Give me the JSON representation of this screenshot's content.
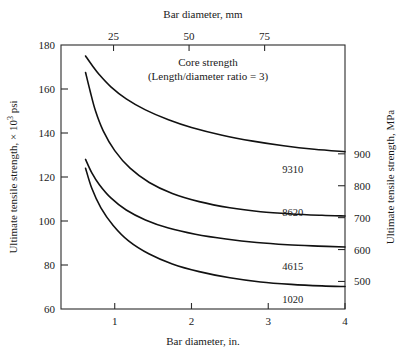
{
  "chart_data": {
    "type": "line",
    "title": "",
    "annotation": {
      "line1": "Core strength",
      "line2": "(Length/diameter ratio = 3)"
    },
    "xlabel": "Bar diameter, in.",
    "xlabel_top": "Bar diameter, mm",
    "ylabel": "Ultimate tensile strength, × 10³ psi",
    "ylabel_right": "Ultimate tensile strength, MPa",
    "xlim": [
      0.3,
      4.0
    ],
    "ylim": [
      60,
      180
    ],
    "xticks": [
      1,
      2,
      3,
      4
    ],
    "xticklabels": [
      "1",
      "2",
      "3",
      "4"
    ],
    "xticks_top_mm": [
      25,
      50,
      75
    ],
    "xticklabels_top": [
      "25",
      "50",
      "75"
    ],
    "yticks": [
      60,
      80,
      100,
      120,
      140,
      160,
      180
    ],
    "yticklabels": [
      "60",
      "80",
      "100",
      "120",
      "140",
      "160",
      "180"
    ],
    "yticks_right_mpa": [
      500,
      600,
      700,
      800,
      900
    ],
    "yticklabels_right": [
      "500",
      "600",
      "700",
      "800",
      "900"
    ],
    "grid": false,
    "legend_position": "inline-end-of-curve",
    "series": [
      {
        "name": "9310",
        "label": "9310",
        "label_x": 3.32,
        "label_y": 123.5,
        "x": [
          0.62,
          0.7,
          0.8,
          0.95,
          1.15,
          1.4,
          1.7,
          2.0,
          2.4,
          2.8,
          3.2,
          3.6,
          4.0
        ],
        "y": [
          175.0,
          171.0,
          166.5,
          161.0,
          155.5,
          150.5,
          146.0,
          142.5,
          139.0,
          136.3,
          134.2,
          132.6,
          131.5
        ]
      },
      {
        "name": "8620",
        "label": "8620",
        "label_x": 3.32,
        "label_y": 104.0,
        "x": [
          0.62,
          0.68,
          0.75,
          0.85,
          1.0,
          1.2,
          1.45,
          1.75,
          2.1,
          2.5,
          2.9,
          3.3,
          3.7,
          4.0
        ],
        "y": [
          167.5,
          159.0,
          150.0,
          141.0,
          132.0,
          124.0,
          117.5,
          112.5,
          108.8,
          106.0,
          104.2,
          103.2,
          102.6,
          102.3
        ]
      },
      {
        "name": "4615",
        "label": "4615",
        "label_x": 3.32,
        "label_y": 79.5,
        "x": [
          0.62,
          0.7,
          0.8,
          0.95,
          1.15,
          1.4,
          1.7,
          2.05,
          2.45,
          2.85,
          3.25,
          3.65,
          4.0
        ],
        "y": [
          128.0,
          122.0,
          116.5,
          110.5,
          105.0,
          100.5,
          96.8,
          94.0,
          91.8,
          90.2,
          89.2,
          88.6,
          88.2
        ]
      },
      {
        "name": "1020",
        "label": "1020",
        "label_x": 3.32,
        "label_y": 64.5,
        "x": [
          0.62,
          0.7,
          0.82,
          0.98,
          1.18,
          1.45,
          1.75,
          2.1,
          2.5,
          2.9,
          3.3,
          3.7,
          4.0
        ],
        "y": [
          124.0,
          115.0,
          106.0,
          98.0,
          91.0,
          85.0,
          80.5,
          77.0,
          74.2,
          72.3,
          71.2,
          70.5,
          70.2
        ]
      }
    ]
  },
  "style": {
    "line_color": "#111111",
    "axis_color": "#2b2b2b",
    "background": "#ffffff"
  }
}
